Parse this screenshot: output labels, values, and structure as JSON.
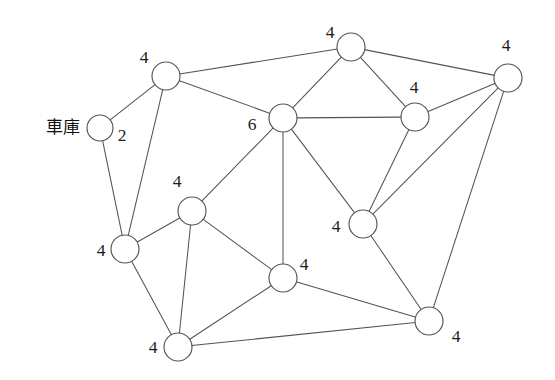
{
  "diagram": {
    "type": "undirected-node-link-graph",
    "background_color": "#ffffff",
    "edge_color": "#55554f",
    "node_fill_color": "#ffffff",
    "node_stroke_color": "#55554f",
    "label_color": "#1c1c1c",
    "node_radius": 13,
    "depot_label_text": "車庫",
    "depot_label_position": {
      "x": 63,
      "y": 128
    },
    "nodes": [
      {
        "id": "depot",
        "cx": 100,
        "cy": 128,
        "r": 13,
        "label": "2",
        "label_x": 122,
        "label_y": 137,
        "is_depot": true,
        "name": "node-depot"
      },
      {
        "id": "top-left",
        "cx": 166,
        "cy": 76,
        "r": 14,
        "label": "4",
        "label_x": 144,
        "label_y": 59,
        "is_depot": false,
        "name": "node-top-left"
      },
      {
        "id": "top",
        "cx": 351,
        "cy": 47,
        "r": 14,
        "label": "4",
        "label_x": 330,
        "label_y": 34,
        "is_depot": false,
        "name": "node-top"
      },
      {
        "id": "top-right",
        "cx": 508,
        "cy": 78,
        "r": 14,
        "label": "4",
        "label_x": 506,
        "label_y": 47,
        "is_depot": false,
        "name": "node-top-right"
      },
      {
        "id": "center",
        "cx": 283,
        "cy": 118,
        "r": 14,
        "label": "6",
        "label_x": 252,
        "label_y": 126,
        "is_depot": false,
        "name": "node-center"
      },
      {
        "id": "right-upper",
        "cx": 415,
        "cy": 117,
        "r": 14,
        "label": "4",
        "label_x": 414,
        "label_y": 89,
        "is_depot": false,
        "name": "node-right-upper"
      },
      {
        "id": "right-mid",
        "cx": 363,
        "cy": 224,
        "r": 14,
        "label": "4",
        "label_x": 336,
        "label_y": 228,
        "is_depot": false,
        "name": "node-right-mid"
      },
      {
        "id": "bottom-right",
        "cx": 429,
        "cy": 321,
        "r": 14,
        "label": "4",
        "label_x": 456,
        "label_y": 338,
        "is_depot": false,
        "name": "node-bottom-right"
      },
      {
        "id": "mid-left",
        "cx": 192,
        "cy": 211,
        "r": 14,
        "label": "4",
        "label_x": 177,
        "label_y": 183,
        "is_depot": false,
        "name": "node-mid-left"
      },
      {
        "id": "left-lower",
        "cx": 125,
        "cy": 249,
        "r": 14,
        "label": "4",
        "label_x": 101,
        "label_y": 252,
        "is_depot": false,
        "name": "node-left-lower"
      },
      {
        "id": "bottom-center",
        "cx": 283,
        "cy": 278,
        "r": 14,
        "label": "4",
        "label_x": 304,
        "label_y": 266,
        "is_depot": false,
        "name": "node-bottom-center"
      },
      {
        "id": "bottom-left",
        "cx": 178,
        "cy": 347,
        "r": 14,
        "label": "4",
        "label_x": 153,
        "label_y": 349,
        "is_depot": false,
        "name": "node-bottom-left"
      }
    ],
    "edges": [
      {
        "from": "depot",
        "to": "top-left",
        "name": "edge-depot-top-left"
      },
      {
        "from": "depot",
        "to": "left-lower",
        "name": "edge-depot-left-lower"
      },
      {
        "from": "top-left",
        "to": "top",
        "name": "edge-top-left-top"
      },
      {
        "from": "top-left",
        "to": "center",
        "name": "edge-top-left-center"
      },
      {
        "from": "top-left",
        "to": "left-lower",
        "name": "edge-top-left-left-lower"
      },
      {
        "from": "top",
        "to": "center",
        "name": "edge-top-center"
      },
      {
        "from": "top",
        "to": "right-upper",
        "name": "edge-top-right-upper"
      },
      {
        "from": "top",
        "to": "top-right",
        "name": "edge-top-top-right"
      },
      {
        "from": "top-right",
        "to": "right-upper",
        "name": "edge-top-right-right-upper"
      },
      {
        "from": "top-right",
        "to": "right-mid",
        "name": "edge-top-right-right-mid"
      },
      {
        "from": "top-right",
        "to": "bottom-right",
        "name": "edge-top-right-bottom-right"
      },
      {
        "from": "center",
        "to": "right-upper",
        "name": "edge-center-right-upper"
      },
      {
        "from": "center",
        "to": "right-mid",
        "name": "edge-center-right-mid"
      },
      {
        "from": "center",
        "to": "bottom-center",
        "name": "edge-center-bottom-center"
      },
      {
        "from": "center",
        "to": "mid-left",
        "name": "edge-center-mid-left"
      },
      {
        "from": "right-upper",
        "to": "right-mid",
        "name": "edge-right-upper-right-mid"
      },
      {
        "from": "right-mid",
        "to": "bottom-right",
        "name": "edge-right-mid-bottom-right"
      },
      {
        "from": "bottom-right",
        "to": "bottom-center",
        "name": "edge-bottom-right-bottom-center"
      },
      {
        "from": "bottom-right",
        "to": "bottom-left",
        "name": "edge-bottom-right-bottom-left"
      },
      {
        "from": "mid-left",
        "to": "left-lower",
        "name": "edge-mid-left-left-lower"
      },
      {
        "from": "mid-left",
        "to": "bottom-center",
        "name": "edge-mid-left-bottom-center"
      },
      {
        "from": "mid-left",
        "to": "bottom-left",
        "name": "edge-mid-left-bottom-left"
      },
      {
        "from": "left-lower",
        "to": "bottom-left",
        "name": "edge-left-lower-bottom-left"
      },
      {
        "from": "bottom-center",
        "to": "bottom-left",
        "name": "edge-bottom-center-bottom-left"
      }
    ]
  }
}
